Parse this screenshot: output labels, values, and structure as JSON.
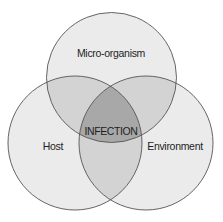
{
  "diagram": {
    "type": "venn",
    "sets": [
      {
        "id": "micro",
        "label": "Micro-organism",
        "cx": 111.5,
        "cy": 77.5,
        "r": 65
      },
      {
        "id": "host",
        "label": "Host",
        "cx": 75,
        "cy": 143,
        "r": 67
      },
      {
        "id": "env",
        "label": "Environment",
        "cx": 146,
        "cy": 143,
        "r": 67
      }
    ],
    "intersection_label": "INFECTION",
    "colors": {
      "single": "#ebebeb",
      "double": "#d3d3d3",
      "triple": "#a8a8a8",
      "stroke": "#555555",
      "background": "#ffffff"
    }
  }
}
